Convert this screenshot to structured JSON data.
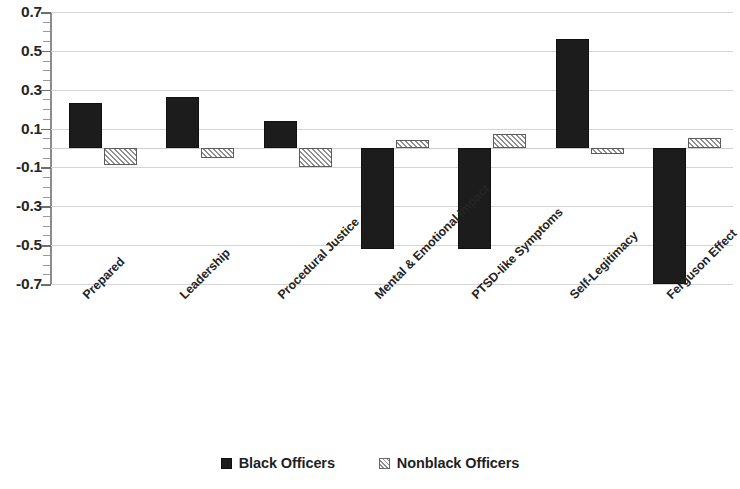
{
  "chart_data": {
    "type": "bar",
    "title": "",
    "subtitle": "",
    "xlabel": "",
    "ylabel": "",
    "ylim": [
      -0.7,
      0.7
    ],
    "ytick_values": [
      0.7,
      0.5,
      0.3,
      0.1,
      -0.1,
      -0.3,
      -0.5,
      -0.7
    ],
    "ytick_labels": [
      "0.7",
      "0.5",
      "0.3",
      "0.1",
      "-0.1",
      "-0.3",
      "-0.5",
      "-0.7"
    ],
    "grid": true,
    "legend_position": "bottom-center",
    "categories": [
      "Prepared",
      "Leadership",
      "Procedural Justice",
      "Mental & Emotional Impact",
      "PTSD-like Symptoms",
      "Self-Legitimacy",
      "Ferguson Effect"
    ],
    "series": [
      {
        "name": "Black Officers",
        "pattern": "solid",
        "color": "#1c1c1c",
        "values": [
          0.23,
          0.26,
          0.14,
          -0.52,
          -0.52,
          0.56,
          -0.7
        ]
      },
      {
        "name": "Nonblack Officers",
        "pattern": "hatched",
        "color": "#8f8f8f",
        "values": [
          -0.09,
          -0.05,
          -0.1,
          0.04,
          0.07,
          -0.03,
          0.05
        ]
      }
    ]
  },
  "legend": {
    "items": [
      {
        "label": "Black Officers",
        "swatch": "solid-square-icon"
      },
      {
        "label": "Nonblack Officers",
        "swatch": "hatched-square-icon"
      }
    ]
  }
}
